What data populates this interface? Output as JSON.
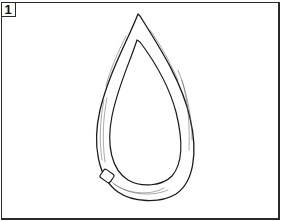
{
  "figure": {
    "panel_label": "1",
    "colors": {
      "line": "#2a2a2a",
      "background": "#ffffff"
    }
  }
}
